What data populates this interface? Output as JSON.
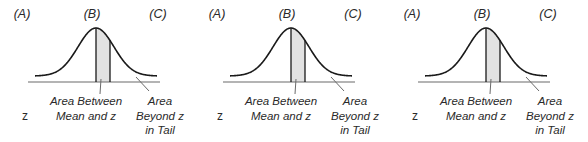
{
  "panels": [
    {
      "col_labels": [
        "(A)",
        "(B)",
        "(C)"
      ],
      "row_label": "z",
      "between_caption": [
        "Area Between",
        "Mean and z"
      ],
      "tail_caption": [
        "Area",
        "Beyond z",
        "in Tail"
      ]
    },
    {
      "col_labels": [
        "(A)",
        "(B)",
        "(C)"
      ],
      "row_label": "z",
      "between_caption": [
        "Area Between",
        "Mean and z"
      ],
      "tail_caption": [
        "Area",
        "Beyond z",
        "in Tail"
      ]
    },
    {
      "col_labels": [
        "(A)",
        "(B)",
        "(C)"
      ],
      "row_label": "z",
      "between_caption": [
        "Area Between",
        "Mean and z"
      ],
      "tail_caption": [
        "Area",
        "Beyond z",
        "in Tail"
      ]
    }
  ],
  "colors": {
    "curve": "#1a1a1a",
    "shade": "#e2e2e2",
    "baseline": "#6a6a6a",
    "text": "#2a2a2a"
  }
}
